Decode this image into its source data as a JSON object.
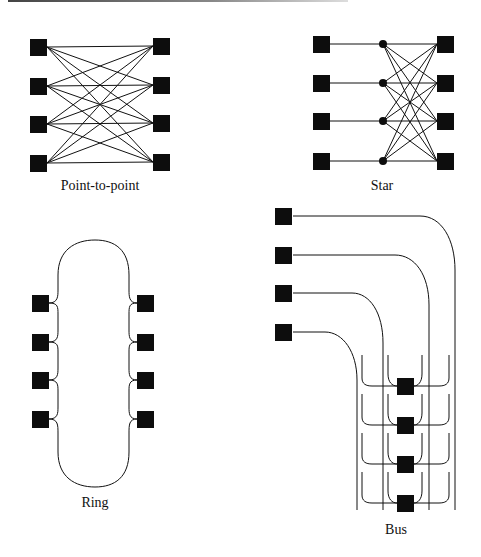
{
  "figure": {
    "panels": [
      {
        "id": "point-to-point",
        "label": "Point-to-point",
        "nodes_left": 4,
        "nodes_right": 4
      },
      {
        "id": "star",
        "label": "Star",
        "nodes_left": 4,
        "hubs": 4,
        "nodes_right": 4
      },
      {
        "id": "ring",
        "label": "Ring",
        "nodes_left": 4,
        "nodes_right": 4
      },
      {
        "id": "bus",
        "label": "Bus",
        "nodes_left": 4,
        "bus_nodes": 4
      }
    ]
  },
  "colors": {
    "line": "#111111",
    "node": "#0d0d0d",
    "background": "#ffffff"
  }
}
